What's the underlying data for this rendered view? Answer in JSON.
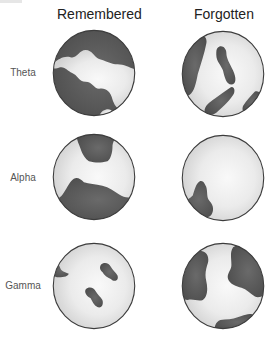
{
  "columns": [
    {
      "label": "Remembered"
    },
    {
      "label": "Forgotten"
    }
  ],
  "rows": [
    {
      "label": "Theta"
    },
    {
      "label": "Alpha"
    },
    {
      "label": "Gamma"
    }
  ],
  "colors": {
    "region_dark": "#5a5a5a",
    "globe_center": "#f7f7f7",
    "globe_edge": "#d4d4d4",
    "outline": "#3c3c3c",
    "background": "#ffffff"
  }
}
